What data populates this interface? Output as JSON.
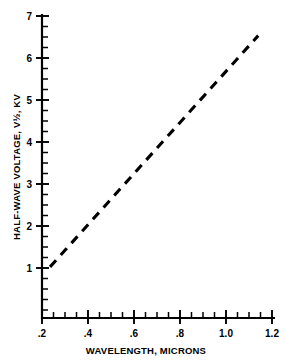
{
  "chart_data": {
    "type": "line",
    "title": "",
    "xlabel": "WAVELENGTH, MICRONS",
    "ylabel": "HALF-WAVE VOLTAGE, V½, KV",
    "xlim": [
      0.2,
      1.2
    ],
    "ylim": [
      0,
      7
    ],
    "grid": false,
    "legend": null,
    "xticks": [
      0.2,
      0.4,
      0.6,
      0.8,
      1.0,
      1.2
    ],
    "xtick_labels": [
      ".2",
      ".4",
      ".6",
      ".8",
      "1.0",
      "1.2"
    ],
    "x_minor_tick_step": 0.05,
    "yticks": [
      1,
      2,
      3,
      4,
      5,
      6,
      7
    ],
    "ytick_labels": [
      "1",
      "2",
      "3",
      "4",
      "5",
      "6",
      "7"
    ],
    "y_minor_tick_step": 0.25,
    "series": [
      {
        "name": "Half-wave voltage vs wavelength",
        "style": "dashed",
        "color": "#000000",
        "x": [
          0.235,
          0.34,
          0.44,
          0.54,
          0.64,
          0.74,
          0.84,
          0.94,
          1.04,
          1.14
        ],
        "y": [
          1.24,
          1.86,
          2.45,
          3.04,
          3.63,
          4.22,
          4.81,
          5.39,
          5.98,
          6.55
        ]
      }
    ]
  },
  "axes": {
    "x": {
      "label": "WAVELENGTH, MICRONS",
      "tick_labels": [
        ".2",
        ".4",
        ".6",
        ".8",
        "1.0",
        "1.2"
      ]
    },
    "y": {
      "label": "HALF-WAVE VOLTAGE, V½, KV",
      "tick_labels": [
        "1",
        "2",
        "3",
        "4",
        "5",
        "6",
        "7"
      ]
    }
  },
  "colors": {
    "background": "#ffffff",
    "ink": "#000000"
  }
}
